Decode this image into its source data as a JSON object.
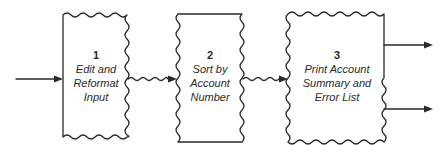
{
  "diagram": {
    "type": "data-flow",
    "processes": [
      {
        "number": "1",
        "lines": [
          "Edit and",
          "Reformat",
          "Input"
        ]
      },
      {
        "number": "2",
        "lines": [
          "Sort by",
          "Account",
          "Number"
        ]
      },
      {
        "number": "3",
        "lines": [
          "Print Account",
          "Summary and",
          "Error List"
        ]
      }
    ],
    "flows": [
      {
        "from": "external",
        "to": "1",
        "style": "straight"
      },
      {
        "from": "1",
        "to": "2",
        "style": "wavy"
      },
      {
        "from": "2",
        "to": "3",
        "style": "wavy"
      },
      {
        "from": "3",
        "to": "external",
        "style": "straight"
      },
      {
        "from": "3",
        "to": "external",
        "style": "straight"
      }
    ],
    "colors": {
      "line": "#2a2a2a",
      "background": "#ffffff"
    }
  }
}
